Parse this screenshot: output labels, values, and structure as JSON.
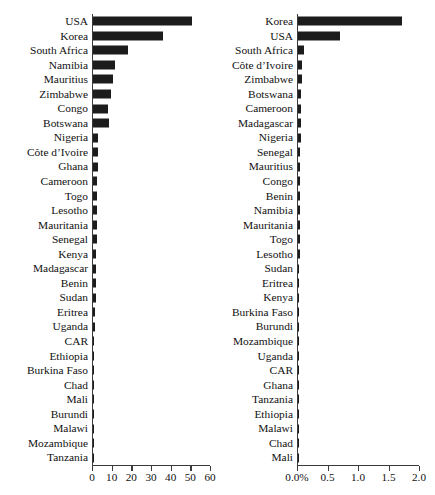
{
  "chart_data": [
    {
      "type": "bar",
      "orientation": "horizontal",
      "panel": "left",
      "title": "",
      "xlabel": "",
      "ylabel": "",
      "xlim": [
        0,
        60
      ],
      "xticks": [
        0,
        10,
        20,
        30,
        40,
        50,
        60
      ],
      "xticklabels": [
        "0",
        "10",
        "20",
        "30",
        "40",
        "50",
        "60"
      ],
      "grid": false,
      "legend": "none",
      "bar_color": "#1c1c1c",
      "categories": [
        "USA",
        "Korea",
        "South Africa",
        "Namibia",
        "Mauritius",
        "Zimbabwe",
        "Congo",
        "Botswana",
        "Nigeria",
        "Côte d’Ivoire",
        "Ghana",
        "Cameroon",
        "Togo",
        "Lesotho",
        "Mauritania",
        "Senegal",
        "Kenya",
        "Madagascar",
        "Benin",
        "Sudan",
        "Eritrea",
        "Uganda",
        "CAR",
        "Ethiopia",
        "Burkina Faso",
        "Chad",
        "Mali",
        "Burundi",
        "Malawi",
        "Mozambique",
        "Tanzania"
      ],
      "values": [
        50.8,
        36.0,
        18.5,
        11.8,
        10.8,
        9.7,
        8.2,
        8.7,
        3.0,
        2.9,
        2.8,
        2.7,
        2.6,
        2.5,
        2.4,
        2.3,
        2.2,
        2.0,
        1.9,
        1.8,
        1.7,
        1.3,
        1.2,
        1.0,
        0.9,
        0.8,
        0.7,
        0.6,
        0.5,
        0.4,
        0.3
      ]
    },
    {
      "type": "bar",
      "orientation": "horizontal",
      "panel": "right",
      "title": "",
      "xlabel": "",
      "ylabel": "",
      "xlim": [
        0,
        2.0
      ],
      "xticks": [
        0,
        0.5,
        1.0,
        1.5,
        2.0
      ],
      "xticklabels": [
        "0.0%",
        "0.5",
        "1.0",
        "1.5",
        "2.0"
      ],
      "grid": false,
      "legend": "none",
      "bar_color": "#1c1c1c",
      "categories": [
        "Korea",
        "USA",
        "South Africa",
        "Côte d’Ivoire",
        "Zimbabwe",
        "Botswana",
        "Cameroon",
        "Madagascar",
        "Nigeria",
        "Senegal",
        "Mauritius",
        "Congo",
        "Benin",
        "Namibia",
        "Mauritania",
        "Togo",
        "Lesotho",
        "Sudan",
        "Eritrea",
        "Kenya",
        "Burkina Faso",
        "Burundi",
        "Mozambique",
        "Uganda",
        "CAR",
        "Ghana",
        "Tanzania",
        "Ethiopia",
        "Malawi",
        "Chad",
        "Mali"
      ],
      "values": [
        1.72,
        0.7,
        0.12,
        0.085,
        0.075,
        0.07,
        0.065,
        0.06,
        0.058,
        0.056,
        0.054,
        0.052,
        0.05,
        0.048,
        0.046,
        0.044,
        0.042,
        0.04,
        0.038,
        0.036,
        0.034,
        0.032,
        0.03,
        0.028,
        0.026,
        0.024,
        0.022,
        0.02,
        0.018,
        0.016,
        0.014
      ]
    }
  ]
}
